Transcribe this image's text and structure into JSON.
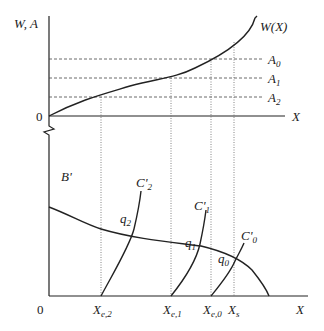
{
  "diagram": {
    "top_panel": {
      "y_axis_label": "W, A",
      "x_axis_label": "X",
      "origin_label": "0",
      "curve_label": "W(X)",
      "levels": [
        {
          "name": "A",
          "sub": "0"
        },
        {
          "name": "A",
          "sub": "1"
        },
        {
          "name": "A",
          "sub": "2"
        }
      ]
    },
    "bottom_panel": {
      "origin_label": "0",
      "x_axis_label": "X",
      "demand_curve_label": "B'",
      "cost_curves": [
        {
          "name": "C'",
          "sub": "2"
        },
        {
          "name": "C'",
          "sub": "1"
        },
        {
          "name": "C'",
          "sub": "0"
        }
      ],
      "intersections": [
        {
          "name": "q",
          "sub": "2"
        },
        {
          "name": "q",
          "sub": "1"
        },
        {
          "name": "q",
          "sub": "0"
        }
      ],
      "x_ticks": [
        {
          "name": "X",
          "sub": "e,2"
        },
        {
          "name": "X",
          "sub": "e,1"
        },
        {
          "name": "X",
          "sub": "e,0"
        },
        {
          "name": "X",
          "sub": "s"
        }
      ]
    }
  }
}
